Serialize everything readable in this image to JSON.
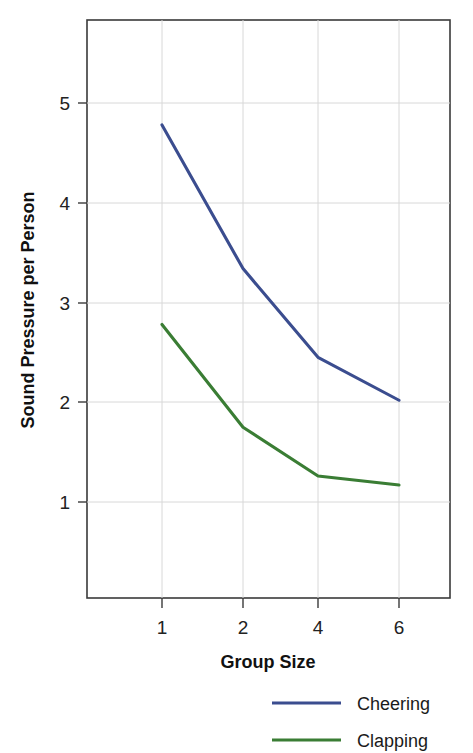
{
  "chart_data": {
    "type": "line",
    "title": "",
    "xlabel": "Group Size",
    "ylabel": "Sound Pressure per Person",
    "categories": [
      "1",
      "2",
      "4",
      "6"
    ],
    "x_tick_labels": [
      "1",
      "2",
      "4",
      "6"
    ],
    "y_tick_labels": [
      "1",
      "2",
      "3",
      "4",
      "5"
    ],
    "y_ticks": [
      1,
      2,
      3,
      4,
      5
    ],
    "ylim": [
      0.38,
      5.78
    ],
    "grid": true,
    "legend_position": "bottom-right",
    "series": [
      {
        "name": "Cheering",
        "color": "#3b4d8f",
        "values": [
          4.78,
          3.34,
          2.45,
          2.02
        ]
      },
      {
        "name": "Clapping",
        "color": "#3a7d34",
        "values": [
          2.78,
          1.75,
          1.26,
          1.17
        ]
      }
    ]
  },
  "axes": {
    "y_axis_title": "Sound Pressure per Person",
    "x_axis_title": "Group Size"
  },
  "legend": {
    "items": [
      {
        "label": "Cheering",
        "color": "#3b4d8f"
      },
      {
        "label": "Clapping",
        "color": "#3a7d34"
      }
    ]
  },
  "ticks": {
    "y": [
      "5",
      "4",
      "3",
      "2",
      "1"
    ],
    "x": [
      "1",
      "2",
      "4",
      "6"
    ]
  }
}
